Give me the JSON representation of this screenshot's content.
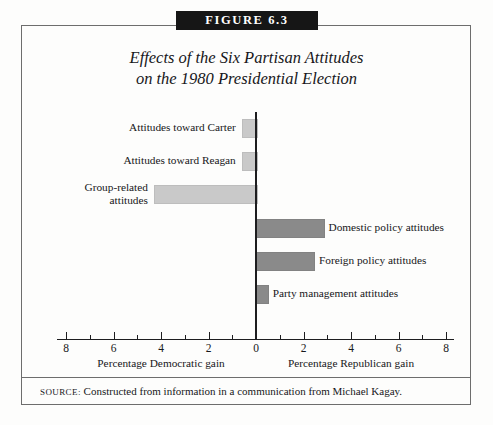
{
  "banner": {
    "label": "FIGURE 6.3"
  },
  "title": {
    "line1": "Effects of the Six Partisan Attitudes",
    "line2": "on the 1980 Presidential Election"
  },
  "source": {
    "label": "SOURCE:",
    "text": "Constructed from information in a communication from Michael Kagay."
  },
  "axis": {
    "left_caption": "Percentage Democratic gain",
    "right_caption": "Percentage Republican gain",
    "tick_labels": [
      "8",
      "6",
      "4",
      "2",
      "0",
      "2",
      "4",
      "6",
      "8"
    ]
  },
  "colors": {
    "democratic_bar": "#c9c9c9",
    "republican_bar": "#8a8a8a",
    "axis": "#1d1d1f",
    "banner_bg": "#161616",
    "frame": "#6d6d6d"
  },
  "chart_data": {
    "type": "bar",
    "orientation": "horizontal",
    "title": "Effects of the Six Partisan Attitudes on the 1980 Presidential Election",
    "xlabel": "Percentage gain (Democratic ← | → Republican)",
    "ylabel": "",
    "xlim": [
      -8,
      8
    ],
    "xticks": [
      -8,
      -6,
      -4,
      -2,
      0,
      2,
      4,
      6,
      8
    ],
    "xtick_labels": [
      "8",
      "6",
      "4",
      "2",
      "0",
      "2",
      "4",
      "6",
      "8"
    ],
    "minor_xticks": [
      -7,
      -5,
      -3,
      -1,
      1,
      3,
      5,
      7
    ],
    "grid": false,
    "legend": false,
    "categories": [
      "Attitudes toward Carter",
      "Attitudes toward Reagan",
      "Group-related attitudes",
      "Domestic policy attitudes",
      "Foreign policy attitudes",
      "Party management attitudes"
    ],
    "values": [
      -0.6,
      -0.6,
      -4.3,
      2.8,
      2.4,
      0.45
    ],
    "series": [
      {
        "name": "Percentage Democratic gain",
        "values": [
          0.6,
          0.6,
          4.3,
          0,
          0,
          0
        ]
      },
      {
        "name": "Percentage Republican gain",
        "values": [
          0,
          0,
          0,
          2.8,
          2.4,
          0.45
        ]
      }
    ],
    "bars": [
      {
        "label": "Attitudes toward Carter",
        "value": 0.6,
        "side": "democratic",
        "label_line1": "Attitudes toward Carter",
        "label_line2": ""
      },
      {
        "label": "Attitudes toward Reagan",
        "value": 0.6,
        "side": "democratic",
        "label_line1": "Attitudes toward Reagan",
        "label_line2": ""
      },
      {
        "label": "Group-related attitudes",
        "value": 4.3,
        "side": "democratic",
        "label_line1": "Group-related",
        "label_line2": "attitudes"
      },
      {
        "label": "Domestic policy attitudes",
        "value": 2.8,
        "side": "republican",
        "label_line1": "Domestic policy attitudes",
        "label_line2": ""
      },
      {
        "label": "Foreign policy attitudes",
        "value": 2.4,
        "side": "republican",
        "label_line1": "Foreign policy attitudes",
        "label_line2": ""
      },
      {
        "label": "Party management attitudes",
        "value": 0.45,
        "side": "republican",
        "label_line1": "Party management attitudes",
        "label_line2": ""
      }
    ]
  }
}
